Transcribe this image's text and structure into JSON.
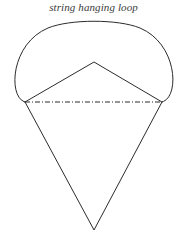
{
  "figure": {
    "caption": "string hanging loop",
    "background_color": "#ffffff",
    "stroke_color": "#2b2b2b",
    "stroke_width": 1,
    "width": 187,
    "height": 240
  },
  "chart_data": {
    "type": "diagram",
    "title": "string hanging loop",
    "grid": false,
    "legend": null,
    "xlabel": "",
    "ylabel": "",
    "annotations": [
      {
        "text": "string hanging loop",
        "x": 94,
        "y": 10,
        "style": "italic-serif",
        "anchor": "middle"
      }
    ],
    "elements": [
      {
        "name": "canopy-dome",
        "kind": "closed-curve",
        "description": "rounded dome / parachute canopy spanning the upper region, bulging outward past the attachment points",
        "path": "M 25 102 C 8 98 10 44 48 28 C 70 19 118 19 140 28 C 178 44 180 98 162 102",
        "filled": false
      },
      {
        "name": "upper-triangle",
        "kind": "polyline",
        "description": "inverted V inside the dome, apex at top center, ends at the two attachment points",
        "points": [
          [
            25,
            102
          ],
          [
            94,
            62
          ],
          [
            162,
            102
          ]
        ]
      },
      {
        "name": "chord-dash-dot-line",
        "kind": "line",
        "description": "horizontal dash-dot chord joining the left and right attachment points",
        "points": [
          [
            25,
            102
          ],
          [
            162,
            102
          ]
        ],
        "dash_pattern": "5 2 1 2"
      },
      {
        "name": "lower-triangle",
        "kind": "polyline",
        "description": "downward pointing V formed by the suspension strings meeting at the load point",
        "points": [
          [
            25,
            102
          ],
          [
            94,
            230
          ],
          [
            162,
            102
          ]
        ]
      }
    ],
    "points": [
      {
        "name": "left-attachment-point",
        "x": 25,
        "y": 102
      },
      {
        "name": "right-attachment-point",
        "x": 162,
        "y": 102
      },
      {
        "name": "canopy-apex",
        "x": 94,
        "y": 62
      },
      {
        "name": "canopy-top",
        "x": 94,
        "y": 22
      },
      {
        "name": "load-point",
        "x": 94,
        "y": 230
      },
      {
        "name": "dome-left-extreme",
        "x": 12,
        "y": 70
      },
      {
        "name": "dome-right-extreme",
        "x": 176,
        "y": 70
      }
    ],
    "xlim": [
      0,
      187
    ],
    "ylim": [
      240,
      0
    ]
  }
}
